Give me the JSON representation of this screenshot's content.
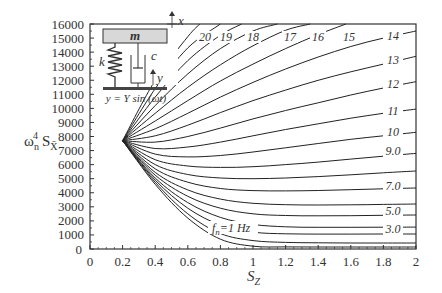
{
  "chart_data": {
    "type": "line",
    "title": "",
    "xlabel": "S_Z",
    "ylabel": "ω_n^4 S_X̄",
    "xlim": [
      0,
      2
    ],
    "ylim": [
      0,
      16000
    ],
    "grid": false,
    "x_ticks": [
      "0",
      "0.2",
      "0.4",
      "0.6",
      "0.8",
      "1",
      "1.2",
      "1.4",
      "1.6",
      "1.8",
      "2"
    ],
    "y_ticks": [
      "0",
      "1000",
      "2000",
      "3000",
      "4000",
      "5000",
      "6000",
      "7000",
      "8000",
      "9000",
      "10000",
      "11000",
      "12000",
      "13000",
      "14000",
      "15000",
      "16000"
    ],
    "origin_point": {
      "x": 0.2,
      "y": 7700
    },
    "series": [
      {
        "name": "f_n=1 Hz",
        "label": "f_n=1 Hz",
        "x": [
          0.2,
          0.4,
          0.6,
          0.8,
          1.0,
          1.2,
          1.4,
          1.6,
          1.8,
          2.0
        ],
        "values": [
          7700,
          4600,
          2200,
          700,
          200,
          150,
          140,
          140,
          140,
          140
        ]
      },
      {
        "name": "2",
        "label": "",
        "x": [
          0.2,
          0.4,
          0.6,
          0.8,
          1.0,
          1.2,
          1.4,
          1.6,
          1.8,
          2.0
        ],
        "values": [
          7700,
          4750,
          2500,
          1100,
          600,
          470,
          440,
          430,
          430,
          430
        ]
      },
      {
        "name": "3",
        "label": "3.0",
        "x": [
          0.2,
          0.4,
          0.6,
          0.8,
          1.0,
          1.2,
          1.4,
          1.6,
          1.8,
          2.0
        ],
        "values": [
          7700,
          4900,
          2900,
          1700,
          1200,
          1080,
          1060,
          1060,
          1065,
          1070
        ]
      },
      {
        "name": "4",
        "label": "",
        "x": [
          0.2,
          0.4,
          0.6,
          0.8,
          1.0,
          1.2,
          1.4,
          1.6,
          1.8,
          2.0
        ],
        "values": [
          7700,
          5050,
          3300,
          2250,
          1750,
          1580,
          1540,
          1540,
          1550,
          1560
        ]
      },
      {
        "name": "5",
        "label": "5.0",
        "x": [
          0.2,
          0.4,
          0.6,
          0.8,
          1.0,
          1.2,
          1.4,
          1.6,
          1.8,
          2.0
        ],
        "values": [
          7700,
          5250,
          3750,
          2900,
          2500,
          2380,
          2360,
          2370,
          2395,
          2420
        ]
      },
      {
        "name": "6",
        "label": "",
        "x": [
          0.2,
          0.4,
          0.6,
          0.8,
          1.0,
          1.2,
          1.4,
          1.6,
          1.8,
          2.0
        ],
        "values": [
          7700,
          5450,
          4200,
          3550,
          3250,
          3150,
          3130,
          3140,
          3170,
          3200
        ]
      },
      {
        "name": "7",
        "label": "7.0",
        "x": [
          0.2,
          0.4,
          0.6,
          0.8,
          1.0,
          1.2,
          1.4,
          1.6,
          1.8,
          2.0
        ],
        "values": [
          7700,
          5700,
          4750,
          4300,
          4150,
          4130,
          4160,
          4220,
          4280,
          4340
        ]
      },
      {
        "name": "8",
        "label": "",
        "x": [
          0.2,
          0.4,
          0.6,
          0.8,
          1.0,
          1.2,
          1.4,
          1.6,
          1.8,
          2.0
        ],
        "values": [
          7700,
          6000,
          5300,
          5050,
          5000,
          5050,
          5150,
          5280,
          5420,
          5550
        ]
      },
      {
        "name": "9",
        "label": "9.0",
        "x": [
          0.2,
          0.4,
          0.6,
          0.8,
          1.0,
          1.2,
          1.4,
          1.6,
          1.8,
          2.0
        ],
        "values": [
          7700,
          6350,
          5900,
          5800,
          5850,
          6000,
          6180,
          6390,
          6600,
          6800
        ]
      },
      {
        "name": "10",
        "label": "10",
        "x": [
          0.2,
          0.4,
          0.6,
          0.8,
          1.0,
          1.2,
          1.4,
          1.6,
          1.8,
          2.0
        ],
        "values": [
          7700,
          6750,
          6550,
          6650,
          6900,
          7200,
          7500,
          7800,
          8050,
          8300
        ]
      },
      {
        "name": "11",
        "label": "11",
        "x": [
          0.2,
          0.4,
          0.6,
          0.8,
          1.0,
          1.2,
          1.4,
          1.6,
          1.8,
          2.0
        ],
        "values": [
          7700,
          7150,
          7250,
          7600,
          8050,
          8500,
          8900,
          9300,
          9650,
          9950
        ]
      },
      {
        "name": "12",
        "label": "12",
        "x": [
          0.2,
          0.4,
          0.6,
          0.8,
          1.0,
          1.2,
          1.4,
          1.6,
          1.8,
          2.0
        ],
        "values": [
          7700,
          7600,
          8000,
          8600,
          9250,
          9850,
          10400,
          10950,
          11450,
          11900
        ]
      },
      {
        "name": "13",
        "label": "13",
        "x": [
          0.2,
          0.4,
          0.6,
          0.8,
          1.0,
          1.2,
          1.4,
          1.6,
          1.8,
          2.0
        ],
        "values": [
          7700,
          8050,
          8800,
          9700,
          10550,
          11300,
          12000,
          12600,
          13150,
          13700
        ]
      },
      {
        "name": "14",
        "label": "14",
        "x": [
          0.2,
          0.4,
          0.6,
          0.8,
          1.0,
          1.2,
          1.4,
          1.6,
          1.8,
          2.0
        ],
        "values": [
          7700,
          8550,
          9650,
          10800,
          11850,
          12800,
          13650,
          14400,
          15000,
          15500
        ]
      },
      {
        "name": "15",
        "label": "15",
        "x": [
          0.2,
          0.4,
          0.6,
          0.8,
          1.0,
          1.2,
          1.4,
          1.57
        ],
        "values": [
          7700,
          9100,
          10550,
          11950,
          13150,
          14250,
          15250,
          16000
        ]
      },
      {
        "name": "16",
        "label": "16",
        "x": [
          0.2,
          0.4,
          0.6,
          0.8,
          1.0,
          1.2,
          1.35
        ],
        "values": [
          7700,
          9650,
          11500,
          13100,
          14450,
          15550,
          16000
        ]
      },
      {
        "name": "17",
        "label": "17",
        "x": [
          0.2,
          0.4,
          0.6,
          0.8,
          1.0,
          1.15
        ],
        "values": [
          7700,
          10200,
          12450,
          14250,
          15500,
          16000
        ]
      },
      {
        "name": "18",
        "label": "18",
        "x": [
          0.2,
          0.4,
          0.6,
          0.8,
          0.93
        ],
        "values": [
          7700,
          10800,
          13400,
          15200,
          16000
        ]
      },
      {
        "name": "19",
        "label": "19",
        "x": [
          0.2,
          0.4,
          0.6,
          0.8
        ],
        "values": [
          7700,
          11400,
          14300,
          16000
        ]
      },
      {
        "name": "20",
        "label": "20",
        "x": [
          0.2,
          0.4,
          0.6,
          0.675
        ],
        "values": [
          7700,
          12000,
          15100,
          16000
        ]
      }
    ],
    "annotations": {
      "top_labels": [
        {
          "text": "20",
          "px": 205
        },
        {
          "text": "19",
          "px": 226
        },
        {
          "text": "18",
          "px": 253
        },
        {
          "text": "17",
          "px": 290
        },
        {
          "text": "16",
          "px": 318
        },
        {
          "text": "15",
          "px": 349
        }
      ],
      "right_labels": [
        {
          "text": "14",
          "py": 40
        },
        {
          "text": "13",
          "py": 64
        },
        {
          "text": "12",
          "py": 88
        },
        {
          "text": "11",
          "py": 115
        },
        {
          "text": "10",
          "py": 136
        },
        {
          "text": "9.0",
          "py": 155
        },
        {
          "text": "7.0",
          "py": 190
        },
        {
          "text": "5.0",
          "py": 215
        },
        {
          "text": "3.0",
          "py": 233
        }
      ],
      "fn_label": "f_n=1 Hz"
    },
    "inset": {
      "mass_label": "m",
      "spring_label": "k",
      "damper_label": "c",
      "x_label": "x",
      "y_label": "y",
      "equation": "y = Y sin (ωt)"
    }
  },
  "axes": {
    "x_title_main": "S",
    "x_title_sub": "Z",
    "y_title_omega": "ω",
    "y_title_sub_n": "n",
    "y_title_sup_4": "4",
    "y_title_S": "S",
    "y_title_sub_X": "X̄"
  }
}
